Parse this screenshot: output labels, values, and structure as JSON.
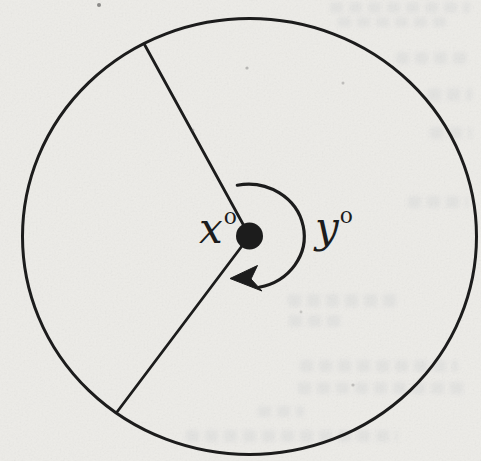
{
  "diagram": {
    "labels": {
      "x": {
        "base": "x",
        "sup": "o"
      },
      "y": {
        "base": "y",
        "sup": "o"
      }
    }
  },
  "colors": {
    "ink": "#1c1c1c",
    "paper": "#edece8"
  }
}
